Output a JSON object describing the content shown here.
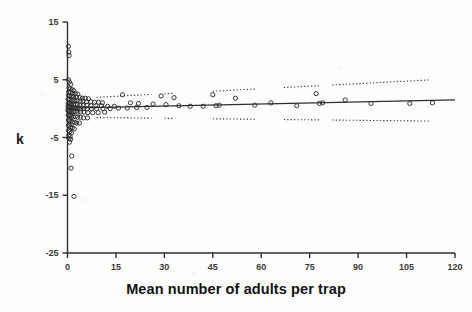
{
  "figure": {
    "background_color": "#fdfdfc",
    "ink_color": "#2e2e2e"
  },
  "axes": {
    "y_title": "k",
    "x_title": "Mean number of adults per trap",
    "y_ticks": [
      15,
      5,
      -5,
      -15,
      -25
    ],
    "x_ticks": [
      0,
      15,
      30,
      45,
      60,
      75,
      90,
      105,
      120
    ]
  },
  "chart_data": {
    "type": "scatter",
    "title": "",
    "xlabel": "Mean number of adults per trap",
    "ylabel": "k",
    "xlim": [
      0,
      120
    ],
    "ylim": [
      -25,
      15
    ],
    "xticks": [
      0,
      15,
      30,
      45,
      60,
      75,
      90,
      105,
      120
    ],
    "yticks": [
      15,
      5,
      -5,
      -15,
      -25
    ],
    "grid": false,
    "legend": "none",
    "marker": "open-circle",
    "points": [
      [
        0.3,
        10.8
      ],
      [
        0.4,
        9.8
      ],
      [
        0.5,
        9.2
      ],
      [
        0.3,
        5.0
      ],
      [
        0.6,
        4.6
      ],
      [
        1.0,
        4.2
      ],
      [
        0.5,
        3.6
      ],
      [
        0.8,
        3.4
      ],
      [
        1.4,
        3.3
      ],
      [
        2.0,
        3.1
      ],
      [
        0.4,
        2.9
      ],
      [
        0.9,
        2.8
      ],
      [
        1.6,
        2.7
      ],
      [
        2.4,
        2.6
      ],
      [
        3.2,
        2.5
      ],
      [
        0.3,
        2.3
      ],
      [
        0.7,
        2.2
      ],
      [
        1.2,
        2.1
      ],
      [
        1.9,
        2.0
      ],
      [
        2.8,
        2.0
      ],
      [
        3.8,
        1.9
      ],
      [
        4.6,
        1.8
      ],
      [
        5.5,
        1.8
      ],
      [
        6.5,
        1.7
      ],
      [
        0.2,
        1.6
      ],
      [
        0.6,
        1.6
      ],
      [
        1.1,
        1.5
      ],
      [
        1.7,
        1.5
      ],
      [
        2.3,
        1.4
      ],
      [
        3.0,
        1.4
      ],
      [
        3.9,
        1.3
      ],
      [
        4.8,
        1.3
      ],
      [
        5.9,
        1.2
      ],
      [
        7.2,
        1.2
      ],
      [
        8.4,
        1.1
      ],
      [
        9.6,
        1.1
      ],
      [
        10.8,
        1.0
      ],
      [
        0.2,
        0.9
      ],
      [
        0.5,
        0.9
      ],
      [
        0.9,
        0.8
      ],
      [
        1.3,
        0.8
      ],
      [
        1.8,
        0.7
      ],
      [
        2.4,
        0.7
      ],
      [
        3.1,
        0.7
      ],
      [
        3.9,
        0.6
      ],
      [
        4.9,
        0.6
      ],
      [
        6.0,
        0.6
      ],
      [
        7.3,
        0.5
      ],
      [
        8.8,
        0.5
      ],
      [
        10.5,
        0.5
      ],
      [
        12.4,
        0.4
      ],
      [
        14.5,
        0.4
      ],
      [
        0.15,
        0.3
      ],
      [
        0.4,
        0.3
      ],
      [
        0.7,
        0.2
      ],
      [
        1.1,
        0.2
      ],
      [
        1.5,
        0.2
      ],
      [
        2.0,
        0.1
      ],
      [
        2.6,
        0.1
      ],
      [
        3.3,
        0.1
      ],
      [
        4.1,
        0.0
      ],
      [
        5.0,
        0.0
      ],
      [
        6.1,
        0.0
      ],
      [
        7.4,
        0.0
      ],
      [
        9.0,
        0.0
      ],
      [
        11.0,
        0.0
      ],
      [
        13.2,
        0.0
      ],
      [
        15.8,
        0.1
      ],
      [
        18.5,
        0.1
      ],
      [
        21.4,
        0.2
      ],
      [
        24.6,
        0.2
      ],
      [
        0.1,
        -0.3
      ],
      [
        0.35,
        -0.3
      ],
      [
        0.6,
        -0.4
      ],
      [
        1.0,
        -0.4
      ],
      [
        1.4,
        -0.5
      ],
      [
        1.9,
        -0.5
      ],
      [
        2.5,
        -0.5
      ],
      [
        3.2,
        -0.6
      ],
      [
        4.0,
        -0.6
      ],
      [
        5.1,
        -0.6
      ],
      [
        6.3,
        -0.7
      ],
      [
        7.8,
        -0.7
      ],
      [
        9.5,
        -0.7
      ],
      [
        11.5,
        -0.6
      ],
      [
        0.2,
        -1.1
      ],
      [
        0.5,
        -1.2
      ],
      [
        0.9,
        -1.2
      ],
      [
        1.3,
        -1.3
      ],
      [
        1.8,
        -1.4
      ],
      [
        2.4,
        -1.4
      ],
      [
        3.1,
        -1.5
      ],
      [
        4.0,
        -1.5
      ],
      [
        5.0,
        -1.6
      ],
      [
        6.2,
        -1.6
      ],
      [
        0.3,
        -2.0
      ],
      [
        0.7,
        -2.1
      ],
      [
        1.1,
        -2.2
      ],
      [
        1.6,
        -2.3
      ],
      [
        2.2,
        -2.4
      ],
      [
        2.9,
        -2.5
      ],
      [
        3.7,
        -2.5
      ],
      [
        0.25,
        -2.9
      ],
      [
        0.6,
        -3.0
      ],
      [
        1.0,
        -3.2
      ],
      [
        1.5,
        -3.3
      ],
      [
        2.1,
        -3.5
      ],
      [
        0.3,
        -3.8
      ],
      [
        0.7,
        -4.0
      ],
      [
        1.2,
        -4.2
      ],
      [
        0.4,
        -4.6
      ],
      [
        0.8,
        -4.8
      ],
      [
        0.5,
        -5.2
      ],
      [
        1.0,
        -5.3
      ],
      [
        0.6,
        -5.8
      ],
      [
        1.3,
        -8.2
      ],
      [
        1.1,
        -10.3
      ],
      [
        2.0,
        -15.2
      ],
      [
        17.0,
        2.4
      ],
      [
        19.5,
        1.0
      ],
      [
        22.0,
        0.9
      ],
      [
        26.5,
        0.8
      ],
      [
        29.0,
        2.2
      ],
      [
        30.5,
        0.7
      ],
      [
        33.0,
        1.9
      ],
      [
        34.5,
        0.5
      ],
      [
        38.0,
        0.4
      ],
      [
        42.0,
        0.4
      ],
      [
        45.0,
        2.4
      ],
      [
        46.0,
        0.5
      ],
      [
        47.0,
        0.6
      ],
      [
        52.0,
        1.8
      ],
      [
        58.0,
        0.6
      ],
      [
        63.0,
        1.0
      ],
      [
        71.0,
        0.5
      ],
      [
        77.0,
        2.6
      ],
      [
        78.0,
        0.9
      ],
      [
        79.0,
        1.0
      ],
      [
        86.0,
        1.5
      ],
      [
        94.0,
        0.9
      ],
      [
        106.0,
        0.9
      ],
      [
        113.0,
        1.0
      ]
    ],
    "series": [
      {
        "name": "regression-line",
        "type": "line",
        "style": "solid",
        "x": [
          0,
          120
        ],
        "y": [
          0.1,
          1.5
        ]
      },
      {
        "name": "upper-confidence-band",
        "type": "line",
        "style": "dotted",
        "x": [
          0,
          120
        ],
        "y": [
          1.7,
          5.2
        ]
      },
      {
        "name": "lower-confidence-band",
        "type": "line",
        "style": "dotted",
        "x": [
          0,
          120
        ],
        "y": [
          -1.5,
          -2.2
        ]
      }
    ]
  }
}
